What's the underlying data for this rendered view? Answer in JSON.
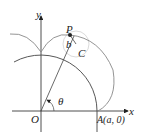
{
  "diagram": {
    "labels": {
      "y_axis": "y",
      "x_axis": "x",
      "origin": "O",
      "point_p": "P",
      "radius_b": "b",
      "center_c": "C",
      "angle": "θ",
      "point_a": "A(a, 0)"
    },
    "colors": {
      "curve": "#888888",
      "axis": "#222222",
      "circle": "#444444",
      "small_circle": "#cccccc"
    }
  }
}
